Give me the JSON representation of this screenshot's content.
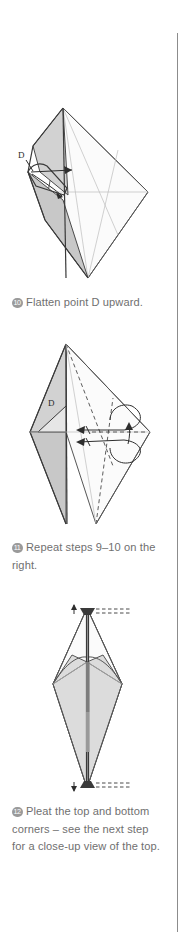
{
  "page": {
    "background_color": "#ffffff",
    "text_color": "#6f6f6f",
    "badge_color": "#9a9a9a",
    "rule_color": "#8c8c8c"
  },
  "steps": [
    {
      "number": "10",
      "caption": "Flatten point D upward.",
      "figure": {
        "name": "kite-with-flap-diagram",
        "point_labels": [
          "D"
        ],
        "shading": "#d2d2d2"
      }
    },
    {
      "number": "11",
      "caption": "Repeat steps 9–10 on the right.",
      "figure": {
        "name": "kite-fold-arrows-diagram",
        "point_labels": [
          "D"
        ],
        "shading": "#d2d2d2"
      }
    },
    {
      "number": "12",
      "caption": "Pleat the top and bottom corners – see the next step for a close-up view of the top.",
      "figure": {
        "name": "tall-diamond-pleat-diagram",
        "point_labels": [],
        "shading": "#d2d2d2"
      }
    }
  ]
}
